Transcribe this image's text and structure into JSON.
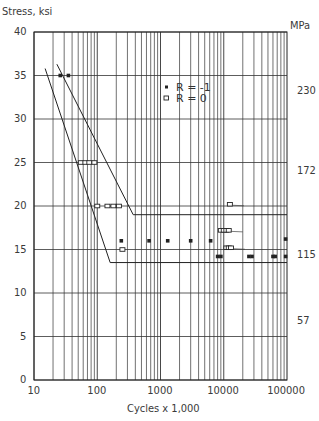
{
  "chart_data": {
    "type": "scatter",
    "title": "",
    "ylabel": "Stress, ksi",
    "ylabel_right": "MPa",
    "xlabel": "Cycles x 1,000",
    "xscale": "log",
    "xlim": [
      10,
      100000
    ],
    "ylim": [
      0,
      40
    ],
    "x_ticks": [
      "10",
      "100",
      "1000",
      "10000",
      "100000"
    ],
    "y_ticks": [
      "0",
      "5",
      "10",
      "15",
      "20",
      "25",
      "30",
      "35",
      "40"
    ],
    "y_ticks_right": [
      "57",
      "115",
      "172",
      "230"
    ],
    "grid": true,
    "legend": {
      "position": "upper-center",
      "entries": [
        {
          "marker": "filled-square",
          "label": "R = -1"
        },
        {
          "marker": "open-square",
          "label": "R = 0"
        }
      ]
    },
    "series": [
      {
        "name": "R = -1",
        "marker": "filled-square",
        "points": [
          [
            26,
            35
          ],
          [
            35,
            35
          ],
          [
            240,
            16
          ],
          [
            660,
            16
          ],
          [
            1300,
            16
          ],
          [
            3000,
            16
          ],
          [
            6200,
            16
          ],
          [
            8000,
            14.2
          ],
          [
            9000,
            14.2
          ],
          [
            25000,
            14.2
          ],
          [
            28000,
            14.2
          ],
          [
            60000,
            14.2
          ],
          [
            65000,
            14.2
          ],
          [
            95000,
            14.2
          ],
          [
            95000,
            16.2
          ]
        ]
      },
      {
        "name": "R = 0",
        "marker": "open-square",
        "points": [
          [
            55,
            25
          ],
          [
            65,
            25
          ],
          [
            75,
            25
          ],
          [
            90,
            25
          ],
          [
            100,
            20
          ],
          [
            145,
            20
          ],
          [
            180,
            20
          ],
          [
            220,
            20
          ],
          [
            250,
            15
          ],
          [
            12500,
            20.2
          ],
          [
            9000,
            17.2
          ],
          [
            10000,
            17.2
          ],
          [
            11000,
            17.2
          ],
          [
            12000,
            17.2
          ],
          [
            11000,
            15.2
          ],
          [
            12000,
            15.2
          ],
          [
            13000,
            15.2
          ]
        ],
        "runouts": [
          [
            12500,
            20.2
          ],
          [
            12000,
            17.2
          ],
          [
            13000,
            15.2
          ]
        ]
      }
    ],
    "curves": [
      {
        "name": "R = -1 fit",
        "points": [
          [
            23,
            36.3
          ],
          [
            370,
            19
          ],
          [
            100000,
            19
          ]
        ]
      },
      {
        "name": "R = 0 fit",
        "points": [
          [
            15,
            35.8
          ],
          [
            160,
            13.5
          ],
          [
            100000,
            13.5
          ]
        ]
      }
    ]
  }
}
